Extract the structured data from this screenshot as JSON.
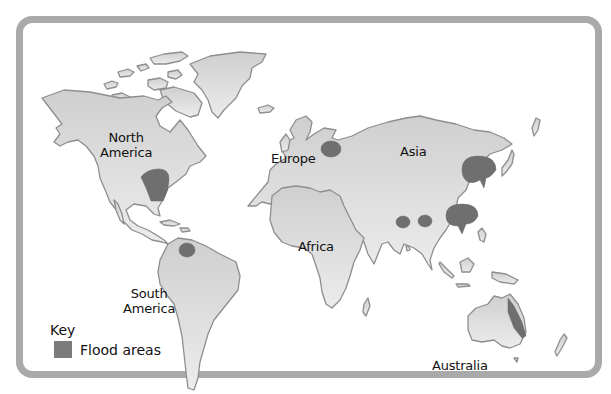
{
  "map": {
    "title": "",
    "type": "world map",
    "colors": {
      "frame": "#a9a9a9",
      "land": "#d6d6d6",
      "land_outline": "#8e8e8e",
      "flood": "#6f6f6f",
      "background": "#ffffff"
    },
    "continent_labels": {
      "north_america": [
        "North",
        "America"
      ],
      "south_america": [
        "South",
        "America"
      ],
      "europe": "Europe",
      "asia": "Asia",
      "africa": "Africa",
      "australia": "Australia"
    },
    "flood_areas": [
      {
        "region": "North America (Mississippi basin)"
      },
      {
        "region": "Northern South America (Venezuela)"
      },
      {
        "region": "Eastern Europe"
      },
      {
        "region": "Northern China"
      },
      {
        "region": "Southern China"
      },
      {
        "region": "India (west)"
      },
      {
        "region": "Bangladesh"
      },
      {
        "region": "Eastern Australia"
      }
    ],
    "key": {
      "title": "Key",
      "items": [
        {
          "label": "Flood areas",
          "swatch_color": "#7b7b7b"
        }
      ]
    }
  }
}
